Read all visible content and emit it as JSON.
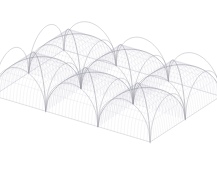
{
  "figure": {
    "background_color": "#ffffff",
    "width": 217,
    "height": 193
  },
  "render": {
    "projection": "oblique-perspective",
    "line_color_mesh": "#c9c9d2",
    "line_color_rib": "#8a8a96",
    "line_color_edge": "#9a9aa6",
    "line_color_boundary": "#b0b0bb",
    "mesh_stroke_width": 0.3,
    "rib_stroke_width": 0.55,
    "edge_stroke_width": 0.45,
    "mesh_opacity": 0.55,
    "rib_opacity": 0.85
  },
  "geometry": {
    "bays_u": 3,
    "bays_v": 2,
    "bay_size": 1.0,
    "vault_rise": 0.62,
    "mesh_divisions": 16,
    "rib_divisions": 40,
    "camera": {
      "yaw_deg": 34,
      "pitch_deg": 26,
      "scale": 63,
      "origin_x": 107,
      "origin_y": 96
    }
  },
  "landmarks": {
    "top_apex": {
      "x": 110,
      "y": 8
    },
    "right_corner": {
      "x": 212,
      "y": 50
    },
    "left_corner": {
      "x": 5,
      "y": 118
    },
    "bottom_apex": {
      "x": 95,
      "y": 186
    },
    "center_node": {
      "x": 72,
      "y": 122
    },
    "right_node": {
      "x": 142,
      "y": 108
    }
  }
}
